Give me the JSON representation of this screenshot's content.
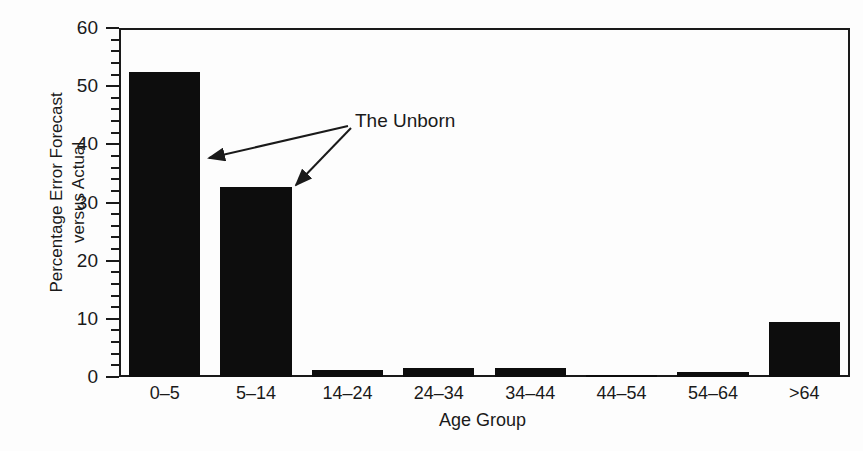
{
  "chart_data": {
    "type": "bar",
    "title": "",
    "xlabel": "Age Group",
    "ylabel": "Percentage Error Forecast versus Actual",
    "ylabel_lines": [
      "Percentage Error Forecast",
      "versus Actual"
    ],
    "categories": [
      "0–5",
      "5–14",
      "14–24",
      "24–34",
      "34–44",
      "44–54",
      "54–64",
      ">64"
    ],
    "values": [
      52.4,
      32.6,
      1.2,
      1.5,
      1.5,
      0.4,
      0.8,
      9.5
    ],
    "ylim": [
      0,
      60
    ],
    "y_major_ticks": [
      0,
      10,
      20,
      30,
      40,
      50,
      60
    ],
    "y_tick_labels": [
      "0",
      "10",
      "20",
      "30",
      "40",
      "50",
      "60"
    ],
    "y_minor_tick_interval": 2,
    "grid": false,
    "legend": null,
    "bar_color": "#0d0d0d",
    "axis_color": "#1a1a1a",
    "background_color": "#fdfdfd",
    "annotations": [
      {
        "text": "The Unborn",
        "label_x": 355,
        "label_y": 110,
        "targets": [
          "0–5",
          "5–14"
        ]
      }
    ]
  },
  "figure": {
    "width": 863,
    "height": 451
  }
}
